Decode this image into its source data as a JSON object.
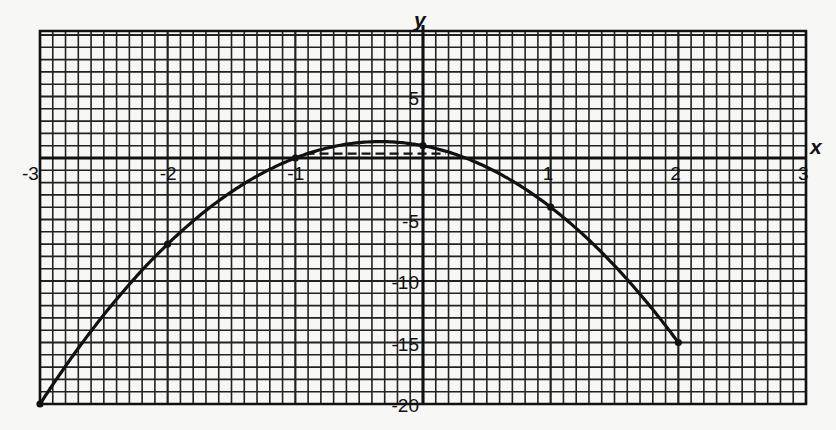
{
  "chart_data": {
    "type": "line",
    "title": "",
    "xlabel": "x",
    "ylabel": "y",
    "xlim": [
      -3,
      3
    ],
    "ylim": [
      -20,
      10
    ],
    "grid": true,
    "grid_minor_x_step": 0.1,
    "grid_minor_y_step": 1,
    "x_ticks": [
      {
        "value": -3,
        "label": "-3"
      },
      {
        "value": -2,
        "label": "-2"
      },
      {
        "value": -1,
        "label": "-1"
      },
      {
        "value": 1,
        "label": "1"
      },
      {
        "value": 2,
        "label": "2"
      },
      {
        "value": 3,
        "label": "3"
      }
    ],
    "y_ticks": [
      {
        "value": 5,
        "label": "5"
      },
      {
        "value": -5,
        "label": "-5"
      },
      {
        "value": -10,
        "label": "-10"
      },
      {
        "value": -15,
        "label": "-15"
      },
      {
        "value": -20,
        "label": "-20"
      }
    ],
    "series": [
      {
        "name": "y = 1 - 2x - 3x²",
        "x": [
          -3,
          -2,
          -1,
          0,
          1,
          2
        ],
        "y": [
          -20,
          -7,
          0,
          1,
          -4,
          -15
        ],
        "marked_points": true,
        "domain": [
          -3,
          2
        ]
      }
    ],
    "annotations": [
      {
        "type": "dashed-horizontal-line",
        "y": 0.35,
        "x_from": -0.92,
        "x_to": 0.18
      }
    ],
    "legend": null
  },
  "colors": {
    "paper": "#f7f7f5",
    "ink": "#111111",
    "grid": "#222222"
  }
}
